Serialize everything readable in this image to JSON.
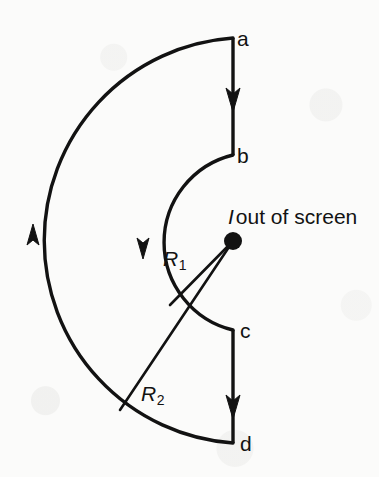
{
  "figure": {
    "stroke_color": "#121212",
    "background_color": "#fbfbfa"
  },
  "labels": {
    "point_a": "a",
    "point_b": "b",
    "point_c": "c",
    "point_d": "d",
    "radius_inner_symbol": "R",
    "radius_inner_subscript": "1",
    "radius_outer_symbol": "R",
    "radius_outer_subscript": "2",
    "current_symbol": "I",
    "current_text": "out of screen"
  },
  "geometry": {
    "center": {
      "x": 233,
      "y": 241,
      "dot_radius": 9
    },
    "inner_arc": {
      "radius": 90,
      "start_point": "b",
      "end_point": "c",
      "start_xy": {
        "x": 233,
        "y": 155
      },
      "end_xy": {
        "x": 233,
        "y": 330
      },
      "sweep": "counterclockwise-left-half",
      "arrow_direction": "down",
      "arrow_xy": {
        "x": 143,
        "y": 241
      }
    },
    "outer_arc": {
      "radius": 203,
      "start_point": "a",
      "end_point": "d",
      "start_xy": {
        "x": 233,
        "y": 38
      },
      "end_xy": {
        "x": 233,
        "y": 443
      },
      "sweep": "counterclockwise-left-half",
      "arrow_direction": "up",
      "arrow_xy": {
        "x": 33,
        "y": 241
      }
    },
    "segment_ab": {
      "x": 233,
      "y_start": 38,
      "y_end": 155,
      "arrow_direction": "down"
    },
    "segment_cd": {
      "x": 233,
      "y_start": 330,
      "y_end": 443,
      "arrow_direction": "down"
    },
    "radius_line_inner": {
      "from_xy": {
        "x": 233,
        "y": 241
      },
      "to_xy": {
        "x": 170,
        "y": 305
      }
    },
    "radius_line_outer": {
      "from_xy": {
        "x": 233,
        "y": 241
      },
      "to_xy": {
        "x": 120,
        "y": 410
      }
    }
  },
  "label_positions": {
    "a": {
      "left": 237,
      "top": 28
    },
    "b": {
      "left": 237,
      "top": 145
    },
    "c": {
      "left": 240,
      "top": 320
    },
    "d": {
      "left": 240,
      "top": 433
    },
    "r1": {
      "left": 163,
      "top": 248
    },
    "r2": {
      "left": 141,
      "top": 383
    },
    "current": {
      "left": 228,
      "top": 206
    }
  }
}
